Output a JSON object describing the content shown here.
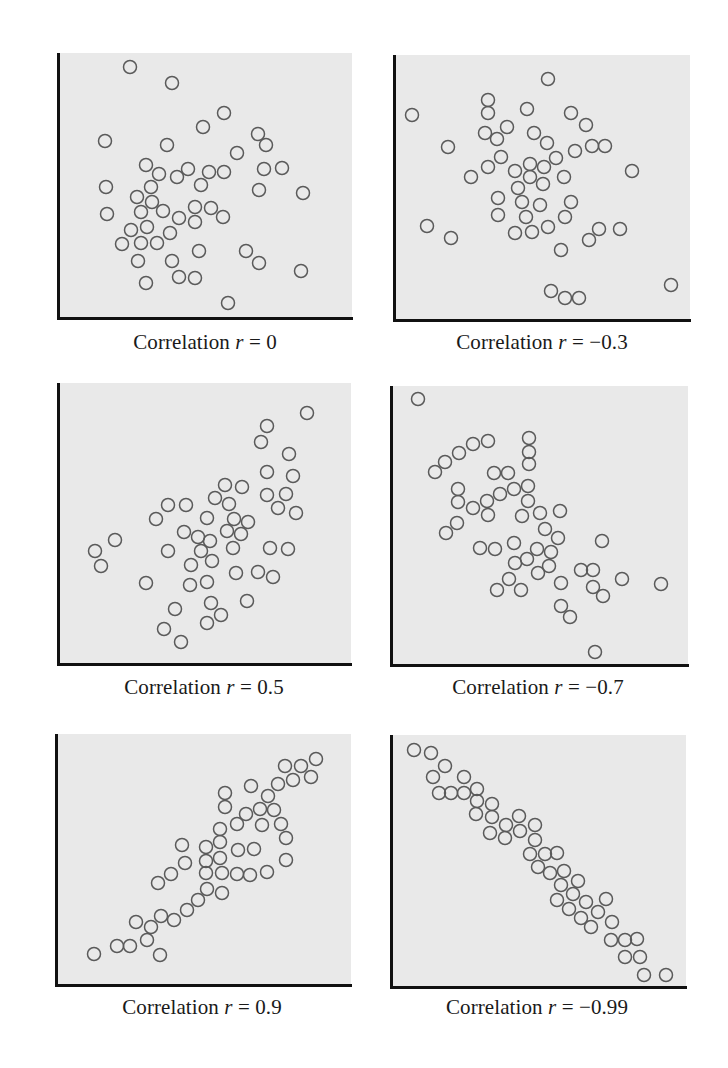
{
  "figure": {
    "marker": {
      "shape": "open-circle",
      "radius": 6.5,
      "stroke": "#5a5a5a",
      "stroke_width": 1.5
    },
    "colors": {
      "plot_background": "#e9e9e9",
      "axis": "#111111",
      "text": "#1a1a1a"
    }
  },
  "panels": [
    {
      "caption_prefix": "Correlation ",
      "caption_var": "r",
      "caption_eq": " = ",
      "caption_value": "0",
      "box": {
        "left": 58,
        "top": 53,
        "right": 352,
        "bottom": 318
      },
      "caption_pos": {
        "x": 205,
        "y": 330
      }
    },
    {
      "caption_prefix": "Correlation ",
      "caption_var": "r",
      "caption_eq": " = ",
      "caption_value": "−0.3",
      "box": {
        "left": 394,
        "top": 55,
        "right": 690,
        "bottom": 320
      },
      "caption_pos": {
        "x": 542,
        "y": 330
      }
    },
    {
      "caption_prefix": "Correlation ",
      "caption_var": "r",
      "caption_eq": " = ",
      "caption_value": "0.5",
      "box": {
        "left": 58,
        "top": 383,
        "right": 351,
        "bottom": 664
      },
      "caption_pos": {
        "x": 204,
        "y": 675
      }
    },
    {
      "caption_prefix": "Correlation ",
      "caption_var": "r",
      "caption_eq": " = ",
      "caption_value": "−0.7",
      "box": {
        "left": 391,
        "top": 386,
        "right": 688,
        "bottom": 665
      },
      "caption_pos": {
        "x": 538,
        "y": 675
      }
    },
    {
      "caption_prefix": "Correlation ",
      "caption_var": "r",
      "caption_eq": " = ",
      "caption_value": "0.9",
      "box": {
        "left": 56,
        "top": 734,
        "right": 351,
        "bottom": 985
      },
      "caption_pos": {
        "x": 202,
        "y": 995
      }
    },
    {
      "caption_prefix": "Correlation ",
      "caption_var": "r",
      "caption_eq": " = ",
      "caption_value": "−0.99",
      "box": {
        "left": 391,
        "top": 735,
        "right": 686,
        "bottom": 987
      },
      "caption_pos": {
        "x": 537,
        "y": 995
      }
    }
  ],
  "chart_data": [
    {
      "type": "scatter",
      "title": "Correlation r = 0",
      "r": 0,
      "xlabel": "",
      "ylabel": "",
      "grid": false,
      "note": "Points in page pixel coordinates [x, y]; axes unlabeled",
      "points": [
        [
          130,
          67
        ],
        [
          172,
          83
        ],
        [
          224,
          113
        ],
        [
          203,
          127
        ],
        [
          258,
          134
        ],
        [
          266,
          145
        ],
        [
          105,
          141
        ],
        [
          167,
          145
        ],
        [
          237,
          153
        ],
        [
          146,
          165
        ],
        [
          159,
          174
        ],
        [
          177,
          177
        ],
        [
          188,
          169
        ],
        [
          209,
          172
        ],
        [
          224,
          172
        ],
        [
          264,
          169
        ],
        [
          282,
          168
        ],
        [
          106,
          187
        ],
        [
          151,
          187
        ],
        [
          201,
          185
        ],
        [
          259,
          190
        ],
        [
          303,
          193
        ],
        [
          137,
          197
        ],
        [
          152,
          202
        ],
        [
          107,
          214
        ],
        [
          141,
          212
        ],
        [
          163,
          211
        ],
        [
          195,
          207
        ],
        [
          211,
          208
        ],
        [
          179,
          218
        ],
        [
          195,
          222
        ],
        [
          223,
          217
        ],
        [
          131,
          230
        ],
        [
          147,
          227
        ],
        [
          170,
          233
        ],
        [
          122,
          244
        ],
        [
          141,
          243
        ],
        [
          157,
          243
        ],
        [
          199,
          251
        ],
        [
          246,
          251
        ],
        [
          138,
          261
        ],
        [
          172,
          261
        ],
        [
          259,
          263
        ],
        [
          301,
          271
        ],
        [
          179,
          277
        ],
        [
          195,
          278
        ],
        [
          146,
          283
        ],
        [
          228,
          303
        ]
      ]
    },
    {
      "type": "scatter",
      "title": "Correlation r = −0.3",
      "r": -0.3,
      "xlabel": "",
      "ylabel": "",
      "grid": false,
      "points": [
        [
          412,
          115
        ],
        [
          488,
          100
        ],
        [
          488,
          113
        ],
        [
          527,
          109
        ],
        [
          548,
          79
        ],
        [
          571,
          113
        ],
        [
          586,
          125
        ],
        [
          507,
          127
        ],
        [
          485,
          133
        ],
        [
          497,
          139
        ],
        [
          534,
          133
        ],
        [
          547,
          143
        ],
        [
          448,
          147
        ],
        [
          575,
          151
        ],
        [
          592,
          146
        ],
        [
          605,
          146
        ],
        [
          501,
          157
        ],
        [
          556,
          158
        ],
        [
          488,
          167
        ],
        [
          530,
          164
        ],
        [
          544,
          167
        ],
        [
          515,
          171
        ],
        [
          632,
          171
        ],
        [
          471,
          177
        ],
        [
          530,
          177
        ],
        [
          564,
          177
        ],
        [
          543,
          184
        ],
        [
          518,
          188
        ],
        [
          498,
          198
        ],
        [
          522,
          202
        ],
        [
          540,
          205
        ],
        [
          571,
          202
        ],
        [
          498,
          215
        ],
        [
          526,
          217
        ],
        [
          565,
          217
        ],
        [
          427,
          226
        ],
        [
          548,
          227
        ],
        [
          515,
          233
        ],
        [
          532,
          232
        ],
        [
          599,
          229
        ],
        [
          620,
          229
        ],
        [
          451,
          238
        ],
        [
          589,
          240
        ],
        [
          561,
          250
        ],
        [
          671,
          285
        ],
        [
          551,
          291
        ],
        [
          565,
          298
        ],
        [
          579,
          298
        ]
      ]
    },
    {
      "type": "scatter",
      "title": "Correlation r = 0.5",
      "r": 0.5,
      "xlabel": "",
      "ylabel": "",
      "grid": false,
      "points": [
        [
          307,
          413
        ],
        [
          267,
          426
        ],
        [
          261,
          442
        ],
        [
          289,
          454
        ],
        [
          267,
          472
        ],
        [
          293,
          476
        ],
        [
          225,
          485
        ],
        [
          242,
          487
        ],
        [
          267,
          495
        ],
        [
          286,
          494
        ],
        [
          215,
          498
        ],
        [
          229,
          504
        ],
        [
          168,
          505
        ],
        [
          186,
          505
        ],
        [
          278,
          508
        ],
        [
          296,
          513
        ],
        [
          156,
          519
        ],
        [
          207,
          518
        ],
        [
          234,
          519
        ],
        [
          248,
          522
        ],
        [
          184,
          532
        ],
        [
          227,
          531
        ],
        [
          241,
          534
        ],
        [
          198,
          537
        ],
        [
          210,
          541
        ],
        [
          115,
          540
        ],
        [
          95,
          551
        ],
        [
          168,
          551
        ],
        [
          201,
          551
        ],
        [
          233,
          548
        ],
        [
          270,
          548
        ],
        [
          288,
          549
        ],
        [
          101,
          566
        ],
        [
          191,
          565
        ],
        [
          212,
          561
        ],
        [
          236,
          573
        ],
        [
          258,
          572
        ],
        [
          273,
          577
        ],
        [
          146,
          583
        ],
        [
          190,
          585
        ],
        [
          207,
          582
        ],
        [
          247,
          601
        ],
        [
          211,
          603
        ],
        [
          175,
          609
        ],
        [
          221,
          615
        ],
        [
          207,
          623
        ],
        [
          164,
          629
        ],
        [
          181,
          642
        ]
      ]
    },
    {
      "type": "scatter",
      "title": "Correlation r = −0.7",
      "r": -0.7,
      "xlabel": "",
      "ylabel": "",
      "grid": false,
      "points": [
        [
          418,
          399
        ],
        [
          488,
          441
        ],
        [
          473,
          444
        ],
        [
          459,
          453
        ],
        [
          445,
          462
        ],
        [
          435,
          472
        ],
        [
          529,
          438
        ],
        [
          529,
          452
        ],
        [
          529,
          464
        ],
        [
          494,
          473
        ],
        [
          508,
          473
        ],
        [
          458,
          489
        ],
        [
          528,
          486
        ],
        [
          514,
          489
        ],
        [
          500,
          494
        ],
        [
          458,
          502
        ],
        [
          487,
          501
        ],
        [
          528,
          501
        ],
        [
          473,
          508
        ],
        [
          488,
          515
        ],
        [
          522,
          516
        ],
        [
          540,
          513
        ],
        [
          560,
          511
        ],
        [
          457,
          523
        ],
        [
          446,
          533
        ],
        [
          545,
          529
        ],
        [
          558,
          538
        ],
        [
          602,
          541
        ],
        [
          480,
          548
        ],
        [
          495,
          549
        ],
        [
          514,
          543
        ],
        [
          537,
          549
        ],
        [
          551,
          552
        ],
        [
          515,
          563
        ],
        [
          527,
          559
        ],
        [
          549,
          566
        ],
        [
          538,
          573
        ],
        [
          581,
          570
        ],
        [
          593,
          570
        ],
        [
          509,
          579
        ],
        [
          622,
          579
        ],
        [
          661,
          584
        ],
        [
          561,
          583
        ],
        [
          497,
          590
        ],
        [
          521,
          590
        ],
        [
          593,
          587
        ],
        [
          603,
          596
        ],
        [
          561,
          606
        ],
        [
          570,
          617
        ],
        [
          595,
          652
        ]
      ]
    },
    {
      "type": "scatter",
      "title": "Correlation r = 0.9",
      "r": 0.9,
      "xlabel": "",
      "ylabel": "",
      "grid": false,
      "points": [
        [
          316,
          759
        ],
        [
          285,
          766
        ],
        [
          301,
          766
        ],
        [
          293,
          780
        ],
        [
          311,
          777
        ],
        [
          251,
          786
        ],
        [
          278,
          784
        ],
        [
          225,
          793
        ],
        [
          268,
          796
        ],
        [
          225,
          807
        ],
        [
          260,
          809
        ],
        [
          274,
          810
        ],
        [
          246,
          814
        ],
        [
          237,
          824
        ],
        [
          262,
          825
        ],
        [
          281,
          824
        ],
        [
          220,
          829
        ],
        [
          286,
          838
        ],
        [
          220,
          842
        ],
        [
          182,
          845
        ],
        [
          206,
          847
        ],
        [
          238,
          850
        ],
        [
          254,
          849
        ],
        [
          206,
          861
        ],
        [
          220,
          858
        ],
        [
          286,
          860
        ],
        [
          185,
          863
        ],
        [
          171,
          874
        ],
        [
          206,
          873
        ],
        [
          222,
          873
        ],
        [
          237,
          874
        ],
        [
          250,
          875
        ],
        [
          267,
          872
        ],
        [
          158,
          883
        ],
        [
          207,
          889
        ],
        [
          222,
          893
        ],
        [
          198,
          900
        ],
        [
          187,
          910
        ],
        [
          161,
          916
        ],
        [
          174,
          920
        ],
        [
          136,
          922
        ],
        [
          151,
          927
        ],
        [
          147,
          940
        ],
        [
          117,
          946
        ],
        [
          130,
          946
        ],
        [
          94,
          954
        ],
        [
          160,
          955
        ]
      ]
    },
    {
      "type": "scatter",
      "title": "Correlation r = −0.99",
      "r": -0.99,
      "xlabel": "",
      "ylabel": "",
      "grid": false,
      "points": [
        [
          414,
          750
        ],
        [
          431,
          753
        ],
        [
          445,
          766
        ],
        [
          433,
          777
        ],
        [
          464,
          777
        ],
        [
          439,
          793
        ],
        [
          451,
          793
        ],
        [
          464,
          793
        ],
        [
          477,
          789
        ],
        [
          477,
          801
        ],
        [
          492,
          804
        ],
        [
          476,
          814
        ],
        [
          492,
          817
        ],
        [
          519,
          816
        ],
        [
          506,
          825
        ],
        [
          535,
          825
        ],
        [
          490,
          833
        ],
        [
          520,
          831
        ],
        [
          505,
          838
        ],
        [
          535,
          840
        ],
        [
          530,
          854
        ],
        [
          545,
          854
        ],
        [
          557,
          853
        ],
        [
          538,
          867
        ],
        [
          550,
          873
        ],
        [
          564,
          871
        ],
        [
          561,
          885
        ],
        [
          578,
          881
        ],
        [
          573,
          894
        ],
        [
          557,
          900
        ],
        [
          586,
          902
        ],
        [
          606,
          899
        ],
        [
          569,
          909
        ],
        [
          598,
          912
        ],
        [
          581,
          918
        ],
        [
          591,
          927
        ],
        [
          612,
          922
        ],
        [
          611,
          940
        ],
        [
          625,
          940
        ],
        [
          637,
          939
        ],
        [
          625,
          957
        ],
        [
          640,
          957
        ],
        [
          644,
          975
        ],
        [
          666,
          975
        ]
      ]
    }
  ]
}
